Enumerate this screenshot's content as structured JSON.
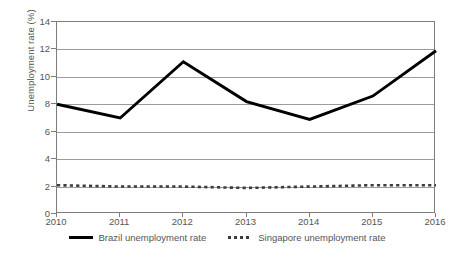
{
  "chart_data": {
    "type": "line",
    "title": "",
    "xlabel": "",
    "ylabel": "Unemployment rate (%)",
    "categories": [
      2010,
      2011,
      2012,
      2013,
      2014,
      2015,
      2016
    ],
    "xtick_labels": [
      "2010",
      "2011",
      "2012",
      "2013",
      "2014",
      "2015",
      "2016"
    ],
    "ytick_labels": [
      "0",
      "2",
      "4",
      "6",
      "8",
      "10",
      "12",
      "14"
    ],
    "ytick_values": [
      0,
      2,
      4,
      6,
      8,
      10,
      12,
      14
    ],
    "ylim": [
      0,
      14
    ],
    "grid": "horizontal",
    "legend_position": "bottom",
    "series": [
      {
        "name": "Brazil unemployment rate",
        "style": "solid",
        "color": "#000000",
        "values": [
          8.0,
          7.0,
          11.1,
          8.2,
          6.9,
          8.6,
          11.9
        ]
      },
      {
        "name": "Singapore unemployment rate",
        "style": "dotted",
        "color": "#3d3d3d",
        "values": [
          2.1,
          2.0,
          2.0,
          1.9,
          2.0,
          2.1,
          2.1
        ]
      }
    ]
  },
  "legend": {
    "items": [
      {
        "label": "Brazil unemployment rate",
        "marker": "solid-line-marker"
      },
      {
        "label": "Singapore unemployment rate",
        "marker": "dotted-line-marker"
      }
    ]
  },
  "axes": {
    "y_title": "Unemployment rate (%)"
  }
}
